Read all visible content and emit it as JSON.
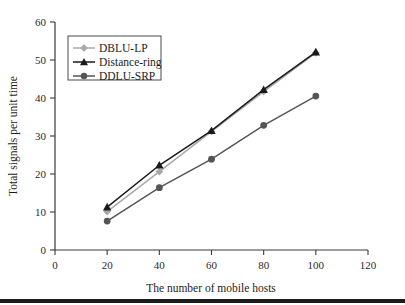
{
  "chart_data": {
    "type": "line",
    "title": "",
    "xlabel": "The number of mobile hosts",
    "ylabel": "Total signals per unit time",
    "x": [
      20,
      40,
      60,
      80,
      100
    ],
    "xlim": [
      0,
      120
    ],
    "ylim": [
      0,
      60
    ],
    "xticks": [
      0,
      20,
      40,
      60,
      80,
      100,
      120
    ],
    "yticks": [
      0,
      10,
      20,
      30,
      40,
      50,
      60
    ],
    "grid": false,
    "legend_position": "upper-left",
    "series": [
      {
        "name": "DBLU-LP",
        "values": [
          10.1,
          20.6,
          31.2,
          41.7,
          51.9
        ],
        "color": "#a8a8a8",
        "marker": "diamond"
      },
      {
        "name": "Distance-ring",
        "values": [
          11.3,
          22.3,
          31.4,
          42.2,
          52.1
        ],
        "color": "#1a1a1a",
        "marker": "triangle"
      },
      {
        "name": "DDLU-SRP",
        "values": [
          7.6,
          16.4,
          23.9,
          32.8,
          40.5
        ],
        "color": "#555555",
        "marker": "circle"
      }
    ]
  },
  "axes": {
    "x_tick_labels": [
      "0",
      "20",
      "40",
      "60",
      "80",
      "100",
      "120"
    ],
    "y_tick_labels": [
      "0",
      "10",
      "20",
      "30",
      "40",
      "50",
      "60"
    ],
    "x_title": "The number of mobile hosts",
    "y_title": "Total signals per unit time"
  },
  "legend": {
    "entries": [
      {
        "label": "DBLU-LP"
      },
      {
        "label": "Distance-ring"
      },
      {
        "label": "DDLU-SRP"
      }
    ]
  }
}
